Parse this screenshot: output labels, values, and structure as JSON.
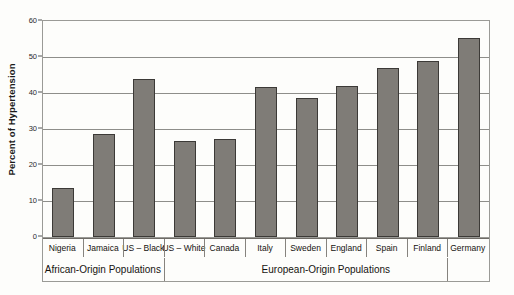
{
  "chart_data": {
    "type": "bar",
    "title": "",
    "xlabel": "",
    "ylabel": "Percent of Hypertension",
    "ylim": [
      0,
      60
    ],
    "yticks": [
      0,
      10,
      20,
      30,
      40,
      50,
      60
    ],
    "ytick_labels": [
      "0",
      "10",
      "20",
      "30",
      "40",
      "50",
      "60"
    ],
    "grid": true,
    "legend": "none",
    "bar_color": "#7f7c77",
    "bar_edge_color": "#3c3a37",
    "categories": [
      "Nigeria",
      "Jamaica",
      "US – Black",
      "US – White",
      "Canada",
      "Italy",
      "Sweden",
      "England",
      "Spain",
      "Finland",
      "Germany"
    ],
    "values": [
      13.5,
      28.6,
      44.0,
      26.8,
      27.3,
      41.6,
      38.6,
      41.9,
      47.0,
      48.9,
      55.3
    ],
    "groups": [
      {
        "label": "African-Origin Populations",
        "start_index": 0,
        "end_index": 2
      },
      {
        "label": "European-Origin Populations",
        "start_index": 3,
        "end_index": 10
      }
    ]
  }
}
